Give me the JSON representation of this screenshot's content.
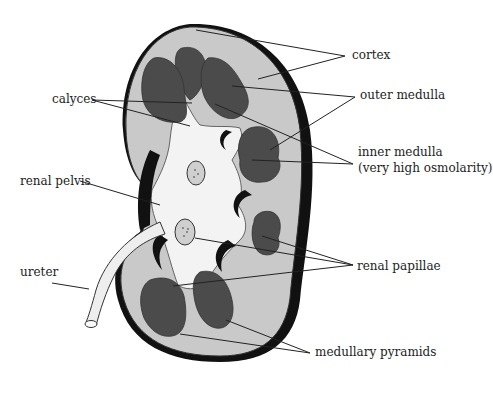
{
  "diagram": {
    "colors": {
      "cortex": "#c8c8c8",
      "medulla": "#4a4a4a",
      "capsule": "#111111",
      "pelvis": "#f2f2f2",
      "leader_line": "#222222"
    },
    "labels": {
      "cortex": "cortex",
      "outer_medulla": "outer medulla",
      "inner_medulla": "inner medulla",
      "inner_medulla_note": "(very high osmolarity)",
      "calyces": "calyces",
      "renal_pelvis": "renal pelvis",
      "ureter": "ureter",
      "renal_papillae": "renal papillae",
      "medullary_pyramids": "medullary pyramids"
    }
  }
}
